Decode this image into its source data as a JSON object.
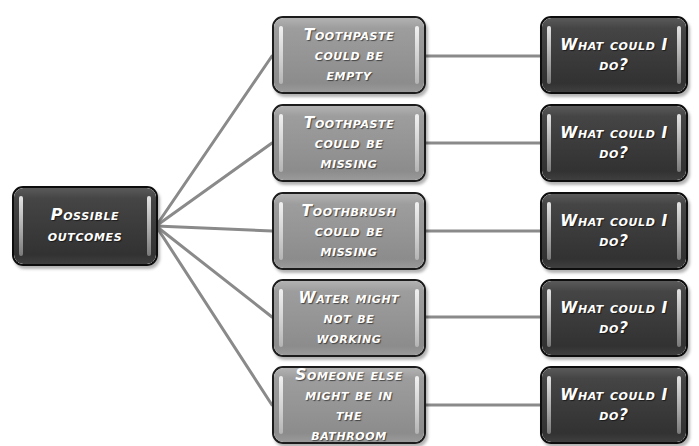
{
  "diagram": {
    "background_color": "#ffffff",
    "node_colors": {
      "root_fill": "#3a3a3a",
      "middle_fill": "#949494",
      "right_fill": "#3a3a3a",
      "border": "#161616",
      "text": "#ffffff",
      "connector": "#8a8a8a"
    },
    "root": {
      "label": "Possible\noutcomes"
    },
    "outcomes": [
      {
        "label": "Toothpaste\ncould be empty",
        "response": "What could I\ndo?"
      },
      {
        "label": "Toothpaste\ncould be\nmissing",
        "response": "What could I\ndo?"
      },
      {
        "label": "Toothbrush\ncould be\nmissing",
        "response": "What could I\ndo?"
      },
      {
        "label": "Water might\nnot be working",
        "response": "What could I\ndo?"
      },
      {
        "label": "Someone else\nmight be in the\nbathroom",
        "response": "What could I\ndo?"
      }
    ]
  }
}
